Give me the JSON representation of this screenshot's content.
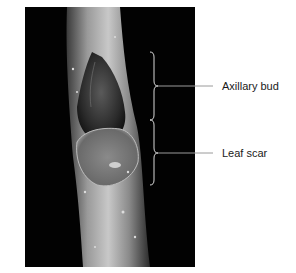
{
  "figure": {
    "labels": [
      {
        "text": "Axillary bud",
        "y": 86
      },
      {
        "text": "Leaf scar",
        "y": 153
      }
    ]
  }
}
